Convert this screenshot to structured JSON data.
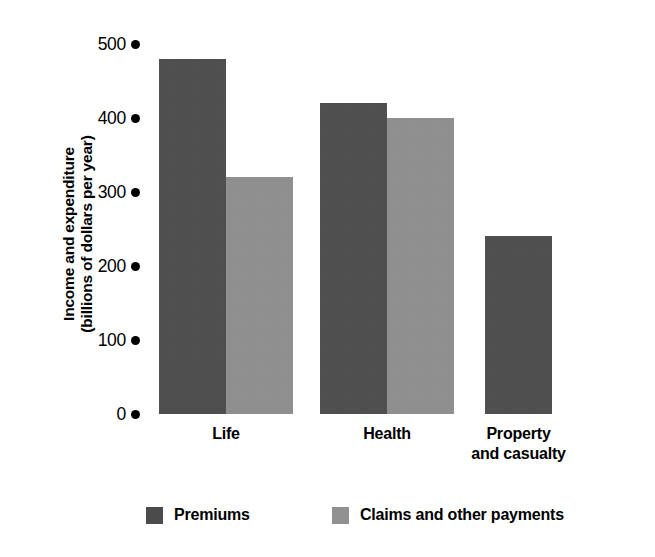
{
  "chart_data": {
    "type": "bar",
    "title": "",
    "subtitle": "",
    "xlabel": "",
    "ylabel": "Income and expenditure (billions of dollars per year)",
    "ylabel_lines": [
      "Income and expenditure",
      "(billions of dollars per year)"
    ],
    "categories": [
      "Life",
      "Health",
      "Property and casualty"
    ],
    "category_lines": [
      [
        "Life"
      ],
      [
        "Health"
      ],
      [
        "Property",
        "and casualty"
      ]
    ],
    "series": [
      {
        "name": "Premiums",
        "color": "#4b4b4b",
        "values": [
          480,
          420,
          240
        ]
      },
      {
        "name": "Claims and other payments",
        "color": "#919191",
        "values": [
          320,
          400,
          null
        ]
      }
    ],
    "ylim": [
      0,
      500
    ],
    "yticks": [
      500,
      400,
      300,
      200,
      100,
      0
    ],
    "ytick_labels": [
      "500",
      "400",
      "300",
      "200",
      "100",
      "0"
    ],
    "ytick_marker": "filled-circle",
    "grid": false,
    "legend_position": "bottom"
  },
  "axis": {
    "y_title_line1": "Income and expenditure",
    "y_title_line2": "(billions of dollars per year)"
  },
  "legend": {
    "items": [
      {
        "label": "Premiums"
      },
      {
        "label": "Claims and other payments"
      }
    ]
  }
}
